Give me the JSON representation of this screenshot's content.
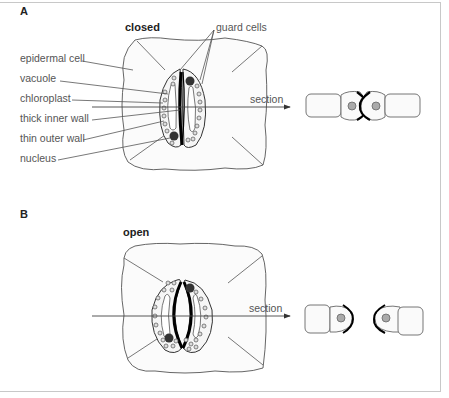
{
  "panel_a": {
    "letter": "A",
    "state": "closed",
    "labels": {
      "guard_cells": "guard cells",
      "epidermal_cell": "epidermal cell",
      "vacuole": "vacuole",
      "chloroplast": "chloroplast",
      "thick_inner_wall": "thick inner wall",
      "thin_outer_wall": "thin outer wall",
      "nucleus": "nucleus",
      "section": "section"
    }
  },
  "panel_b": {
    "letter": "B",
    "state": "open",
    "labels": {
      "section": "section"
    }
  },
  "colors": {
    "line": "#555555",
    "wall": "#000000",
    "nucleus": "#333333",
    "section_nucleus": "#aaaaaa",
    "frame": "#c8c8c8"
  }
}
